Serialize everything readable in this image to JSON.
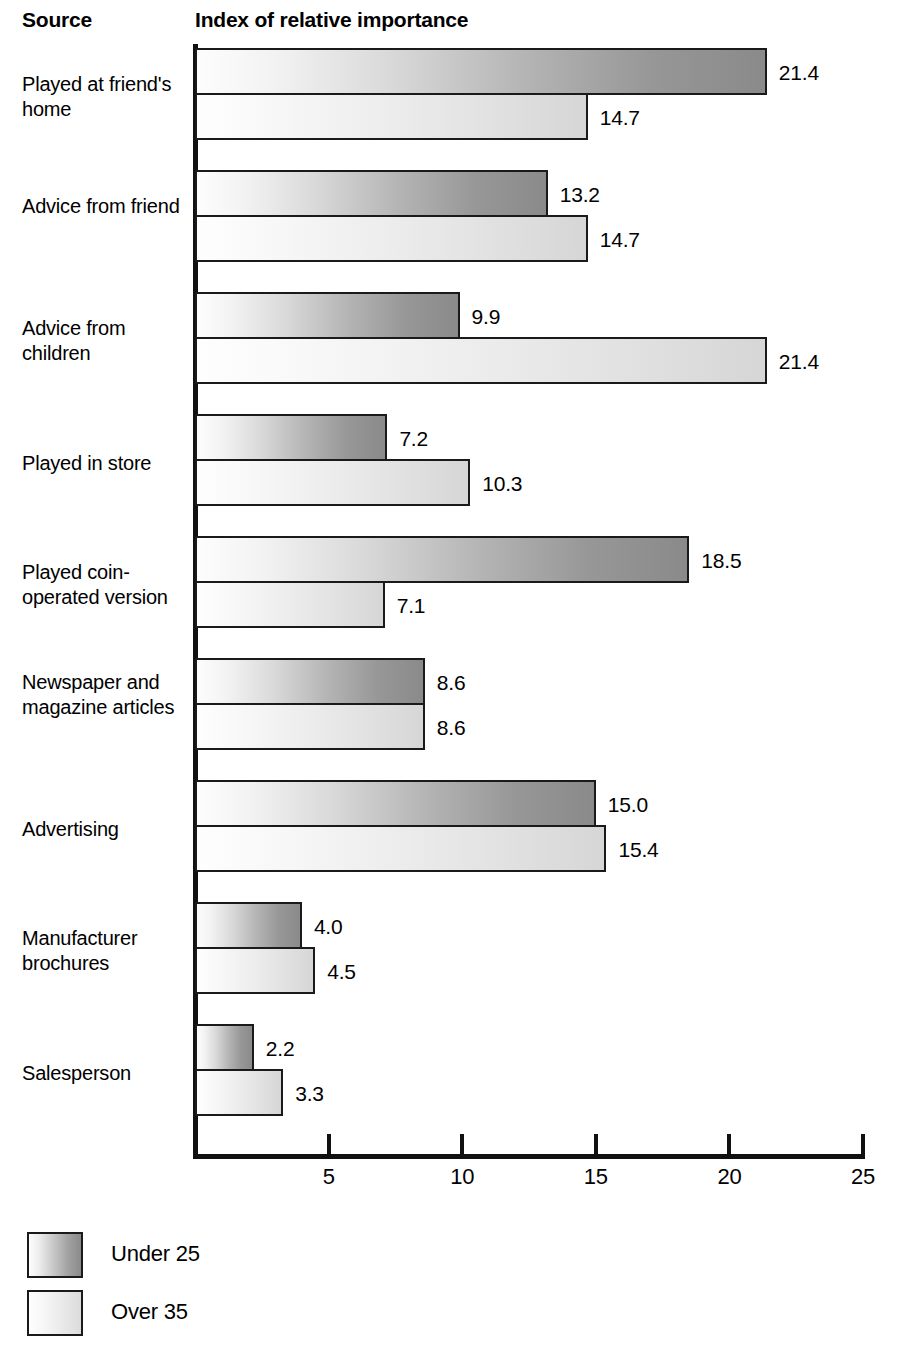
{
  "header": {
    "source_label": "Source",
    "chart_title": "Index of relative importance"
  },
  "legend": {
    "items": [
      {
        "label": "Under 25",
        "swatch": "under25"
      },
      {
        "label": "Over 35",
        "swatch": "over35"
      }
    ]
  },
  "axis": {
    "ticks": [
      "5",
      "10",
      "15",
      "20",
      "25"
    ]
  },
  "rows": [
    {
      "label": "Played at friend's home",
      "under25": "21.4",
      "over35": "14.7"
    },
    {
      "label": "Advice from friend",
      "under25": "13.2",
      "over35": "14.7"
    },
    {
      "label": "Advice from children",
      "under25": "9.9",
      "over35": "21.4"
    },
    {
      "label": "Played in store",
      "under25": "7.2",
      "over35": "10.3"
    },
    {
      "label": "Played coin-operated version",
      "under25": "18.5",
      "over35": "7.1"
    },
    {
      "label": "Newspaper and magazine articles",
      "under25": "8.6",
      "over35": "8.6"
    },
    {
      "label": "Advertising",
      "under25": "15.0",
      "over35": "15.4"
    },
    {
      "label": "Manufacturer brochures",
      "under25": "4.0",
      "over35": "4.5"
    },
    {
      "label": "Salesperson",
      "under25": "2.2",
      "over35": "3.3"
    }
  ],
  "chart_data": {
    "type": "bar",
    "orientation": "horizontal",
    "title": "Index of relative importance",
    "xlabel": "Index of relative importance",
    "ylabel": "Source",
    "xlim": [
      0,
      25
    ],
    "xticks": [
      5,
      10,
      15,
      20,
      25
    ],
    "grid": false,
    "legend_position": "bottom-left",
    "value_labels": true,
    "categories": [
      "Played at friend's home",
      "Advice from friend",
      "Advice from children",
      "Played in store",
      "Played coin-operated version",
      "Newspaper and magazine articles",
      "Advertising",
      "Manufacturer brochures",
      "Salesperson"
    ],
    "series": [
      {
        "name": "Under 25",
        "values": [
          21.4,
          13.2,
          9.9,
          7.2,
          18.5,
          8.6,
          15.0,
          4.0,
          2.2
        ],
        "fill": "gradient white-to-gray",
        "color_start": "#fdfdfd",
        "color_end": "#8a8a8a"
      },
      {
        "name": "Over 35",
        "values": [
          14.7,
          14.7,
          21.4,
          10.3,
          7.1,
          8.6,
          15.4,
          4.5,
          3.3
        ],
        "fill": "gradient white-to-lightgray",
        "color_start": "#fefefe",
        "color_end": "#d6d6d6"
      }
    ]
  },
  "geometry": {
    "axis_x_px": 195,
    "px_per_unit": 26.72,
    "bar_height_px": 47,
    "group_pitch_px": 122,
    "first_group_top_px": 4,
    "label_offset_px": 12
  }
}
